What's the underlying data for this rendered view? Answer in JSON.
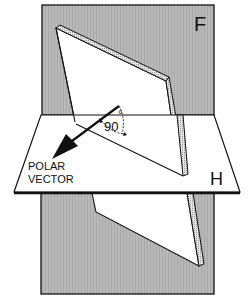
{
  "diagram": {
    "planes": {
      "frontal": {
        "label": "F"
      },
      "horizontal": {
        "label": "H"
      }
    },
    "vector": {
      "label_line1": "POLAR",
      "label_line2": "VECTOR"
    },
    "angle": {
      "value": "90",
      "unit": "°"
    },
    "colors": {
      "plane_fill": "#b9b9b9",
      "paper": "#ffffff",
      "ink": "#111111",
      "edge_texture": "#d8d8d8"
    }
  }
}
